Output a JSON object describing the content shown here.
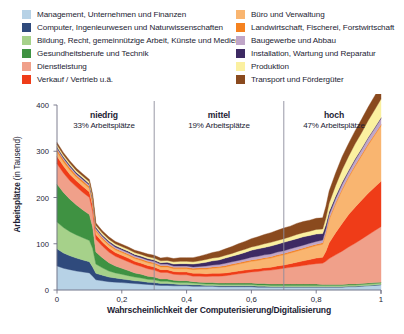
{
  "legend": {
    "left_items": [
      {
        "label": "Management, Unternehmen und Finanzen",
        "color": "#b7d2e6",
        "key": "management"
      },
      {
        "label": "Computer, Ingenieurwesen und Naturwissenschaften",
        "color": "#2f4a7c",
        "key": "computer"
      },
      {
        "label": "Bildung, Recht, gemeinnützige Arbeit, Künste und Medien",
        "color": "#a6d18a",
        "key": "bildung"
      },
      {
        "label": "Gesundheitsberufe und Technik",
        "color": "#3f9242",
        "key": "gesundheit"
      },
      {
        "label": "Dienstleistung",
        "color": "#f0a08a",
        "key": "dienstleistung"
      },
      {
        "label": "Verkauf / Vertrieb u.ä.",
        "color": "#ef3c18",
        "key": "verkauf"
      }
    ],
    "right_items": [
      {
        "label": "Büro und Verwaltung",
        "color": "#f9b570",
        "key": "buero"
      },
      {
        "label": "Landwirtschaft, Fischerei, Forstwirtschaft",
        "color": "#f58220",
        "key": "landwirtschaft"
      },
      {
        "label": "Baugewerbe und Abbau",
        "color": "#c0a6c8",
        "key": "baugewerbe"
      },
      {
        "label": "Installation, Wartung und Reparatur",
        "color": "#3d2a63",
        "key": "installation"
      },
      {
        "label": "Produktion",
        "color": "#fbf0a0",
        "key": "produktion"
      },
      {
        "label": "Transport und Fördergüter",
        "color": "#8a4a1e",
        "key": "transport"
      }
    ]
  },
  "chart_data": {
    "type": "area",
    "stacked": true,
    "title": "",
    "xlabel": "Wahrscheinlichkeit der Computerisierung/Digitalisierung",
    "ylabel": "Arbeitsplätze",
    "ylabel_unit": "(in Tausend)",
    "xlim": [
      0,
      1
    ],
    "ylim": [
      0,
      400
    ],
    "xticks": [
      0,
      0.2,
      0.4,
      0.6,
      0.8,
      1
    ],
    "xtick_labels": [
      "0",
      "0,2",
      "0,4",
      "0,6",
      "0,8",
      "1"
    ],
    "yticks": [
      0,
      100,
      200,
      300,
      400
    ],
    "ytick_labels": [
      "0",
      "100",
      "200",
      "300",
      "400"
    ],
    "grid": false,
    "legend_position": "top",
    "dividers": [
      {
        "x": 0.3,
        "color": "#8c8c9c"
      },
      {
        "x": 0.7,
        "color": "#8c8c9c"
      }
    ],
    "segments": [
      {
        "name": "niedrig",
        "sublabel": "33% Arbeitsplätze",
        "x_center": 0.145,
        "range": [
          0,
          0.3
        ]
      },
      {
        "name": "mittel",
        "sublabel": "19% Arbeitsplätze",
        "x_center": 0.5,
        "range": [
          0.3,
          0.7
        ]
      },
      {
        "name": "hoch",
        "sublabel": "47% Arbeitsplätze",
        "x_center": 0.855,
        "range": [
          0.7,
          1
        ]
      }
    ],
    "x": [
      0.0,
      0.02,
      0.04,
      0.06,
      0.08,
      0.1,
      0.11,
      0.12,
      0.14,
      0.16,
      0.18,
      0.2,
      0.22,
      0.24,
      0.26,
      0.28,
      0.3,
      0.32,
      0.34,
      0.36,
      0.38,
      0.4,
      0.42,
      0.44,
      0.46,
      0.48,
      0.5,
      0.52,
      0.54,
      0.56,
      0.58,
      0.6,
      0.62,
      0.64,
      0.66,
      0.68,
      0.7,
      0.72,
      0.74,
      0.76,
      0.78,
      0.8,
      0.82,
      0.83,
      0.84,
      0.86,
      0.88,
      0.9,
      0.92,
      0.94,
      0.96,
      0.98,
      1.0
    ],
    "series": [
      {
        "name": "Management, Unternehmen und Finanzen",
        "color": "#b7d2e6",
        "values": [
          52,
          47,
          44,
          41,
          39,
          37,
          30,
          22,
          20,
          18,
          17,
          16,
          15,
          14,
          13,
          12,
          11,
          10,
          10,
          9,
          9,
          9,
          8,
          8,
          8,
          8,
          7,
          7,
          7,
          7,
          7,
          7,
          6,
          6,
          6,
          6,
          6,
          6,
          6,
          6,
          6,
          6,
          6,
          6,
          6,
          6,
          6,
          7,
          7,
          8,
          9,
          10,
          11
        ]
      },
      {
        "name": "Computer, Ingenieurwesen und Naturwissenschaften",
        "color": "#2f4a7c",
        "values": [
          37,
          33,
          30,
          28,
          26,
          24,
          20,
          14,
          12,
          10,
          9,
          8,
          7,
          6,
          6,
          5,
          5,
          4,
          4,
          4,
          3,
          3,
          3,
          3,
          2,
          2,
          2,
          2,
          2,
          2,
          2,
          2,
          2,
          2,
          1,
          1,
          1,
          1,
          1,
          1,
          1,
          1,
          1,
          1,
          1,
          1,
          1,
          1,
          1,
          1,
          1,
          1,
          1
        ]
      },
      {
        "name": "Bildung, Recht, gemeinnützige Arbeit, Künste und Medien",
        "color": "#a6d18a",
        "values": [
          58,
          55,
          52,
          50,
          48,
          46,
          40,
          20,
          16,
          13,
          11,
          10,
          9,
          8,
          7,
          6,
          6,
          5,
          5,
          4,
          4,
          4,
          4,
          3,
          3,
          3,
          3,
          3,
          3,
          3,
          3,
          3,
          3,
          3,
          3,
          3,
          3,
          3,
          3,
          3,
          3,
          3,
          3,
          3,
          3,
          3,
          3,
          3,
          3,
          3,
          3,
          3,
          3
        ]
      },
      {
        "name": "Gesundheitsberufe und Technik",
        "color": "#3f9242",
        "values": [
          82,
          76,
          70,
          65,
          60,
          56,
          46,
          26,
          22,
          18,
          15,
          13,
          11,
          9,
          8,
          7,
          6,
          5,
          5,
          4,
          4,
          4,
          3,
          3,
          3,
          3,
          3,
          3,
          3,
          3,
          3,
          3,
          3,
          3,
          3,
          3,
          3,
          3,
          3,
          3,
          3,
          3,
          2,
          2,
          2,
          2,
          2,
          2,
          2,
          2,
          2,
          2,
          2
        ]
      },
      {
        "name": "Dienstleistung",
        "color": "#f0a08a",
        "values": [
          44,
          42,
          40,
          39,
          38,
          37,
          34,
          28,
          25,
          23,
          21,
          20,
          19,
          18,
          17,
          16,
          15,
          14,
          14,
          13,
          13,
          13,
          12,
          13,
          13,
          14,
          15,
          16,
          18,
          20,
          22,
          24,
          26,
          28,
          30,
          32,
          34,
          36,
          38,
          40,
          42,
          44,
          46,
          50,
          56,
          64,
          72,
          80,
          88,
          96,
          104,
          112,
          120
        ]
      },
      {
        "name": "Verkauf / Vertrieb u.ä.",
        "color": "#ef3c18",
        "values": [
          16,
          15,
          14,
          13,
          13,
          12,
          11,
          10,
          9,
          9,
          8,
          8,
          8,
          7,
          7,
          7,
          7,
          6,
          6,
          6,
          6,
          6,
          6,
          6,
          6,
          6,
          6,
          6,
          6,
          6,
          6,
          6,
          6,
          6,
          6,
          7,
          7,
          8,
          9,
          10,
          11,
          12,
          13,
          22,
          34,
          48,
          60,
          70,
          78,
          84,
          90,
          94,
          98
        ]
      },
      {
        "name": "Büro und Verwaltung",
        "color": "#f9b570",
        "values": [
          10,
          9,
          9,
          8,
          8,
          8,
          7,
          7,
          6,
          6,
          6,
          6,
          6,
          6,
          6,
          6,
          6,
          6,
          6,
          6,
          7,
          7,
          8,
          9,
          10,
          11,
          12,
          13,
          14,
          15,
          16,
          17,
          18,
          19,
          20,
          21,
          22,
          23,
          24,
          25,
          26,
          27,
          28,
          38,
          50,
          62,
          72,
          80,
          88,
          96,
          104,
          112,
          120
        ]
      },
      {
        "name": "Landwirtschaft, Fischerei, Forstwirtschaft",
        "color": "#f58220",
        "values": [
          5,
          5,
          5,
          4,
          4,
          4,
          4,
          3,
          3,
          3,
          3,
          3,
          3,
          3,
          3,
          3,
          3,
          3,
          3,
          3,
          3,
          3,
          3,
          3,
          3,
          3,
          3,
          3,
          3,
          3,
          3,
          3,
          3,
          3,
          3,
          3,
          3,
          3,
          3,
          3,
          3,
          3,
          3,
          3,
          3,
          3,
          3,
          3,
          3,
          3,
          3,
          3,
          3
        ]
      },
      {
        "name": "Baugewerbe und Abbau",
        "color": "#c0a6c8",
        "values": [
          3,
          3,
          3,
          3,
          3,
          3,
          3,
          3,
          3,
          3,
          3,
          3,
          3,
          3,
          3,
          3,
          3,
          3,
          3,
          3,
          3,
          3,
          3,
          3,
          4,
          4,
          4,
          5,
          5,
          5,
          5,
          6,
          6,
          6,
          6,
          6,
          6,
          6,
          6,
          6,
          6,
          6,
          6,
          7,
          8,
          9,
          10,
          10,
          11,
          11,
          12,
          12,
          13
        ]
      },
      {
        "name": "Installation, Wartung und Reparatur",
        "color": "#3d2a63",
        "values": [
          3,
          3,
          3,
          3,
          3,
          3,
          3,
          3,
          3,
          3,
          3,
          3,
          3,
          3,
          3,
          3,
          3,
          3,
          4,
          4,
          5,
          5,
          6,
          7,
          8,
          9,
          10,
          11,
          12,
          13,
          14,
          15,
          16,
          16,
          17,
          17,
          18,
          18,
          18,
          18,
          17,
          16,
          14,
          10,
          7,
          5,
          4,
          3,
          3,
          2,
          2,
          2,
          2
        ]
      },
      {
        "name": "Produktion",
        "color": "#fbf0a0",
        "values": [
          4,
          4,
          4,
          4,
          4,
          4,
          4,
          4,
          4,
          4,
          4,
          4,
          4,
          4,
          4,
          4,
          4,
          4,
          4,
          5,
          5,
          5,
          5,
          5,
          6,
          6,
          6,
          6,
          6,
          7,
          7,
          7,
          7,
          8,
          8,
          8,
          8,
          8,
          9,
          9,
          9,
          10,
          10,
          14,
          18,
          23,
          27,
          30,
          32,
          34,
          36,
          38,
          40
        ]
      },
      {
        "name": "Transport und Fördergüter",
        "color": "#8a4a1e",
        "values": [
          5,
          5,
          5,
          5,
          5,
          5,
          5,
          5,
          5,
          5,
          5,
          5,
          5,
          5,
          5,
          6,
          6,
          6,
          7,
          7,
          8,
          8,
          9,
          10,
          11,
          12,
          13,
          14,
          15,
          16,
          17,
          18,
          19,
          20,
          21,
          22,
          23,
          23,
          24,
          24,
          24,
          24,
          24,
          25,
          26,
          27,
          28,
          28,
          28,
          29,
          29,
          30,
          30
        ]
      }
    ]
  }
}
